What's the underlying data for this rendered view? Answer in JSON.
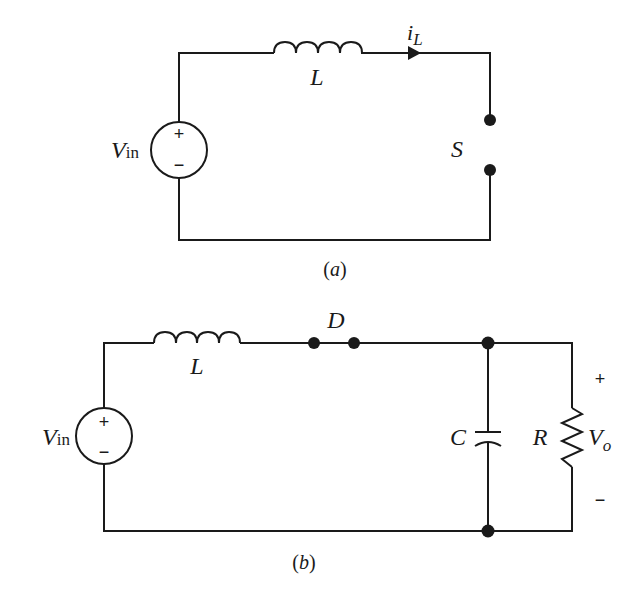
{
  "figure_a": {
    "caption": "(a)",
    "source_label": "V",
    "source_subscript": "in",
    "source_plus": "+",
    "source_minus": "−",
    "inductor_label": "L",
    "current_label": "i",
    "current_subscript": "L",
    "switch_label": "S"
  },
  "figure_b": {
    "caption": "(b)",
    "source_label": "V",
    "source_subscript": "in",
    "source_plus": "+",
    "source_minus": "−",
    "inductor_label": "L",
    "diode_label": "D",
    "capacitor_label": "C",
    "resistor_label": "R",
    "output_label": "V",
    "output_subscript": "o",
    "output_plus": "+",
    "output_minus": "−"
  },
  "colors": {
    "ink": "#1a1a1a",
    "background": "#ffffff"
  }
}
